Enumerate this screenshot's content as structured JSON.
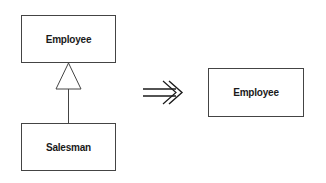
{
  "diagram": {
    "before": {
      "superclass": {
        "name": "Employee"
      },
      "subclass": {
        "name": "Salesman"
      },
      "relationship": "generalization"
    },
    "transform_arrow": "refactoring-arrow",
    "after": {
      "class": {
        "name": "Employee"
      }
    }
  },
  "colors": {
    "stroke": "#444444",
    "text": "#1a1a1a",
    "background": "#ffffff"
  }
}
